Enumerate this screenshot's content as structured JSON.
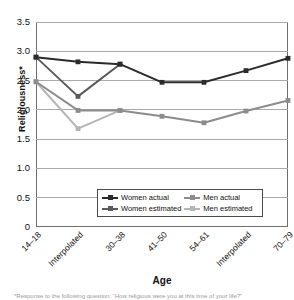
{
  "chart_data": {
    "type": "line",
    "title": "",
    "xlabel": "Age",
    "ylabel": "Religiousness*",
    "categories": [
      "14–18",
      "Interpolated",
      "30–38",
      "41–50",
      "54–61",
      "Interpolated",
      "70–79"
    ],
    "ylim": [
      0,
      3.5
    ],
    "yticks": [
      "0",
      "0.5",
      "1.0",
      "1.5",
      "2.0",
      "2.5",
      "3.0",
      "3.5"
    ],
    "ytick_values": [
      0,
      0.5,
      1.0,
      1.5,
      2.0,
      2.5,
      3.0,
      3.5
    ],
    "grid": "horizontal",
    "legend_position": "inside-bottom-center",
    "series": [
      {
        "name": "Women actual",
        "color": "#2b2b2b",
        "values": [
          2.9,
          2.82,
          2.78,
          2.47,
          2.47,
          2.67,
          2.88
        ]
      },
      {
        "name": "Men actual",
        "color": "#8c8c8c",
        "values": [
          2.48,
          1.99,
          1.99,
          1.89,
          1.78,
          1.98,
          2.16
        ]
      },
      {
        "name": "Women estimated",
        "color": "#5a5a5a",
        "values": [
          2.9,
          2.23,
          2.78,
          null,
          null,
          null,
          null
        ]
      },
      {
        "name": "Men estimated",
        "color": "#b5b5b5",
        "values": [
          2.48,
          1.68,
          1.99,
          null,
          null,
          null,
          null
        ]
      }
    ]
  },
  "axes": {
    "y_title": "Religiousness*",
    "x_title": "Age",
    "y_tick_labels": [
      "3.5",
      "3.0",
      "2.5",
      "2.0",
      "1.5",
      "1.0",
      "0.5",
      "0"
    ],
    "x_tick_labels": [
      "14–18",
      "Interpolated",
      "30–38",
      "41–50",
      "54–61",
      "Interpolated",
      "70–79"
    ]
  },
  "legend": {
    "items": [
      {
        "label": "Women actual",
        "color": "#2b2b2b"
      },
      {
        "label": "Men actual",
        "color": "#8c8c8c"
      },
      {
        "label": "Women estimated",
        "color": "#5a5a5a"
      },
      {
        "label": "Men estimated",
        "color": "#b5b5b5"
      }
    ]
  },
  "footnote": {
    "text": "*Response to the following question: “How religious were you at this time of your life?”"
  },
  "colors": {
    "gridline": "#a9a9a9",
    "axis": "#6e6e6e",
    "plot_background": "#ffffff",
    "text": "#111111"
  }
}
